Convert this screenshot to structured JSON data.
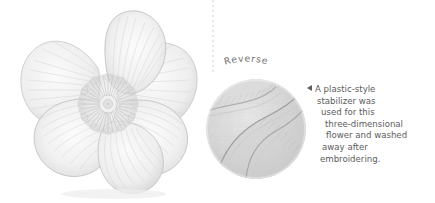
{
  "page": {
    "background_color": "#ffffff",
    "width": 435,
    "height": 203
  },
  "figure": {
    "name": "embroidered-flower",
    "alt_label": "three-dimensional embroidered flower, front view",
    "thread_color": "#d9d9d9",
    "outline_color": "#b9b9b9",
    "petal_count": 6
  },
  "divider": {
    "style": "dotted-vertical",
    "color": "#e6e6e6"
  },
  "reverse": {
    "label": "Reverse",
    "label_color": "#6f6f6f",
    "photo_alt": "circular close-up of the reverse side of the embroidery",
    "photo_color": "#c9c9c9"
  },
  "caption": {
    "marker": "left-triangle",
    "marker_color": "#5c5c5c",
    "text_color": "#5c5c5c",
    "full_text": "A plastic-style stabilizer was used for this three-dimensional flower and washed away after embroidering.",
    "lines": [
      "A plastic-style",
      "stabilizer was",
      "used for this",
      "three-dimensional",
      "flower and washed",
      "away after",
      "embroidering."
    ]
  }
}
